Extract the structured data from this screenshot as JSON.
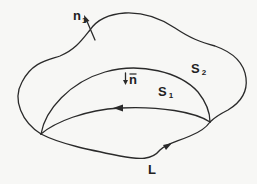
{
  "diagram": {
    "labels": {
      "normal_outer": {
        "main": "n",
        "sub": "1"
      },
      "normal_inner": {
        "main": "n",
        "overbar": true
      },
      "surface_outer": {
        "main": "S",
        "sub": "2"
      },
      "surface_inner": {
        "main": "S",
        "sub": "1"
      },
      "contour": {
        "main": "L"
      }
    },
    "elements": [
      "outer surface S2 boundary curve",
      "inner dome surface S1 curve",
      "closed contour L (ellipse) with direction arrows",
      "normal vector arrow n1 on S2",
      "normal vector arrow n on S1"
    ],
    "colors": {
      "stroke": "#2a2a2a",
      "background": "#f7f7f5"
    }
  }
}
